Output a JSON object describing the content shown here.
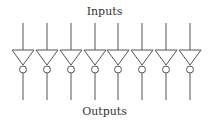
{
  "diagram": {
    "title_top": "Inputs",
    "title_bottom": "Outputs",
    "gate_type": "inverter",
    "gate_count": 8,
    "gate_x_centers": [
      23,
      47,
      71,
      95,
      118,
      142,
      166,
      190
    ],
    "stroke_color": "#555555"
  }
}
